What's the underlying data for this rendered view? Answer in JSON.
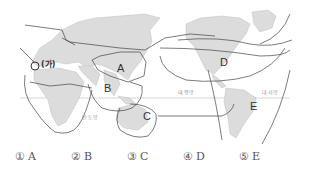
{
  "map": {
    "regions": [
      {
        "id": "A",
        "label": "A"
      },
      {
        "id": "B",
        "label": "B"
      },
      {
        "id": "C",
        "label": "C"
      },
      {
        "id": "D",
        "label": "D"
      },
      {
        "id": "E",
        "label": "E"
      }
    ],
    "marker": {
      "label": "(가)"
    },
    "oceans": {
      "indian": "인도양",
      "pacific": "태평양",
      "atlantic": "대서양"
    },
    "colors": {
      "land": "#dcdcdc",
      "boundary": "#444444",
      "equator": "#aaaaaa"
    }
  },
  "options": [
    {
      "num": "①",
      "label": "A"
    },
    {
      "num": "②",
      "label": "B"
    },
    {
      "num": "③",
      "label": "C"
    },
    {
      "num": "④",
      "label": "D"
    },
    {
      "num": "⑤",
      "label": "E"
    }
  ]
}
